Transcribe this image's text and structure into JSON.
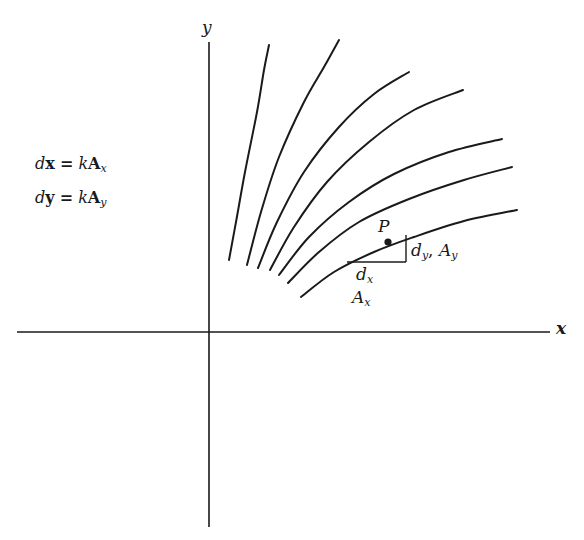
{
  "equations": [
    {
      "lhs_d": "d",
      "lhs_var": "x",
      "eq": "=",
      "k": "k",
      "A": "A",
      "sub": "x"
    },
    {
      "lhs_d": "d",
      "lhs_var": "y",
      "eq": "=",
      "k": "k",
      "A": "A",
      "sub": "y"
    }
  ],
  "axes": {
    "x_label": "x",
    "y_label": "y"
  },
  "point": {
    "label": "P",
    "curve_index": 7
  },
  "triangle_labels": {
    "dy_base": "d",
    "dy_sub": "y",
    "sep": ",",
    "Ay_base": "A",
    "Ay_sub": "y",
    "dx_base": "d",
    "dx_sub": "x",
    "Ax_base": "A",
    "Ax_sub": "x"
  },
  "colors": {
    "ink": "#1a1a1a",
    "background": "#ffffff"
  },
  "chart_data": {
    "type": "line",
    "title": "",
    "xlabel": "x",
    "ylabel": "y",
    "xlim": [
      -192,
      341
    ],
    "ylim": [
      -195,
      290
    ],
    "series": [
      {
        "name": "field-line-1",
        "points": [
          [
            20,
            72
          ],
          [
            27,
            110
          ],
          [
            36,
            160
          ],
          [
            48,
            220
          ],
          [
            55,
            262
          ],
          [
            60,
            287
          ]
        ]
      },
      {
        "name": "field-line-2",
        "points": [
          [
            38,
            67
          ],
          [
            52,
            120
          ],
          [
            70,
            175
          ],
          [
            95,
            230
          ],
          [
            115,
            265
          ],
          [
            130,
            292
          ]
        ]
      },
      {
        "name": "field-line-3",
        "points": [
          [
            49,
            64
          ],
          [
            68,
            110
          ],
          [
            95,
            160
          ],
          [
            130,
            205
          ],
          [
            165,
            238
          ],
          [
            200,
            260
          ]
        ]
      },
      {
        "name": "field-line-4",
        "points": [
          [
            61,
            62
          ],
          [
            85,
            105
          ],
          [
            118,
            150
          ],
          [
            160,
            190
          ],
          [
            205,
            222
          ],
          [
            254,
            242
          ]
        ]
      },
      {
        "name": "field-line-5",
        "points": [
          [
            70,
            57
          ],
          [
            100,
            95
          ],
          [
            140,
            130
          ],
          [
            185,
            158
          ],
          [
            240,
            180
          ],
          [
            293,
            193
          ]
        ]
      },
      {
        "name": "field-line-6",
        "points": [
          [
            79,
            49
          ],
          [
            110,
            80
          ],
          [
            150,
            110
          ],
          [
            200,
            133
          ],
          [
            255,
            152
          ],
          [
            303,
            165
          ]
        ]
      },
      {
        "name": "field-line-7",
        "points": [
          [
            92,
            35
          ],
          [
            125,
            60
          ],
          [
            165,
            80
          ],
          [
            205,
            95
          ],
          [
            255,
            111
          ],
          [
            308,
            122
          ]
        ]
      }
    ],
    "triangle": {
      "corner_x": 197,
      "corner_y": 70,
      "left_x": 138,
      "top_y": 97
    },
    "point_P": [
      179,
      90
    ]
  }
}
